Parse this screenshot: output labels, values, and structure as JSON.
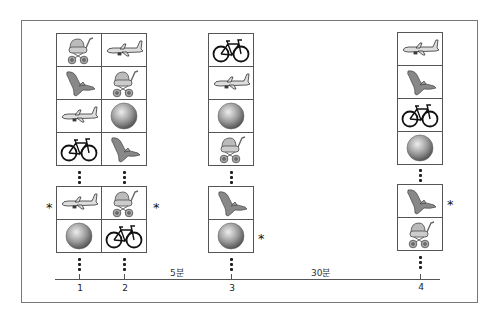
{
  "figure": {
    "columns": [
      {
        "label": "1",
        "top_items": [
          "stroller",
          "crocodile",
          "airplane",
          "bicycle"
        ],
        "bottom_items": [
          "airplane",
          "ball"
        ],
        "starred_bottom_row": 0
      },
      {
        "label": "2",
        "top_items": [
          "airplane",
          "stroller",
          "ball",
          "crocodile"
        ],
        "bottom_items": [
          "stroller",
          "bicycle"
        ],
        "starred_bottom_row": 0
      },
      {
        "label": "3",
        "top_items": [
          "bicycle",
          "airplane",
          "ball",
          "stroller"
        ],
        "bottom_items": [
          "crocodile",
          "ball"
        ],
        "starred_bottom_row": 1
      },
      {
        "label": "4",
        "top_items": [
          "airplane",
          "crocodile",
          "bicycle",
          "ball"
        ],
        "bottom_items": [
          "crocodile",
          "stroller"
        ],
        "starred_bottom_row": 0
      }
    ],
    "intervals": [
      {
        "label": "5분",
        "between": [
          "2",
          "3"
        ]
      },
      {
        "label": "30분",
        "between": [
          "3",
          "4"
        ]
      }
    ],
    "star_symbol": "*",
    "tick_labels": [
      "1",
      "2",
      "3",
      "4"
    ]
  }
}
